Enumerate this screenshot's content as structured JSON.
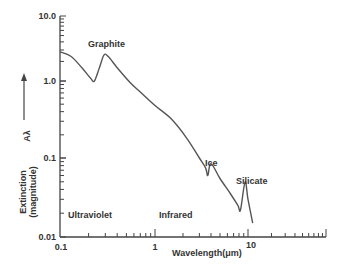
{
  "chart_data": {
    "type": "line",
    "title": "",
    "xlabel": "Wavelength(μm)",
    "ylabel": "Extinction (magnitude)",
    "ylabel_symbol": "Aλ",
    "xscale": "log",
    "yscale": "log",
    "xlim": [
      0.1,
      100
    ],
    "ylim": [
      0.01,
      10.0
    ],
    "x_tick_labels": [
      "0.1",
      "1",
      "10"
    ],
    "y_tick_labels": [
      "0.01",
      "0.1",
      "1.0",
      "10.0"
    ],
    "grid": false,
    "legend": null,
    "annotations": [
      {
        "text": "Graphite",
        "x": 0.3,
        "y": 3.0
      },
      {
        "text": "Ice",
        "x": 3.5,
        "y": 0.09
      },
      {
        "text": "Silicate",
        "x": 9.5,
        "y": 0.055
      },
      {
        "text": "Ultraviolet",
        "x": 0.15,
        "y": 0.015
      },
      {
        "text": "Infrared",
        "x": 0.7,
        "y": 0.015
      }
    ],
    "series": [
      {
        "name": "Extinction curve",
        "x": [
          0.1,
          0.13,
          0.17,
          0.21,
          0.23,
          0.26,
          0.29,
          0.32,
          0.4,
          0.55,
          0.7,
          1.0,
          1.5,
          2.2,
          3.0,
          3.5,
          3.7,
          4.0,
          5.0,
          6.5,
          7.8,
          8.3,
          9.3,
          10.0,
          11.5
        ],
        "y": [
          2.8,
          2.4,
          1.6,
          1.1,
          1.0,
          1.6,
          2.5,
          2.4,
          1.6,
          0.95,
          0.72,
          0.48,
          0.32,
          0.18,
          0.1,
          0.075,
          0.06,
          0.085,
          0.055,
          0.035,
          0.025,
          0.022,
          0.05,
          0.03,
          0.015
        ]
      }
    ]
  },
  "labels": {
    "graphite": "Graphite",
    "ice": "Ice",
    "silicate": "Silicate",
    "ultraviolet": "Ultraviolet",
    "infrared": "Infrared",
    "xlabel": "Wavelength(μm)",
    "ylabel_line1": "Extinction",
    "ylabel_line2": "(magnitude)",
    "ylabel_symbol": "Aλ",
    "x_ticks": [
      "0.1",
      "1",
      "10"
    ],
    "y_ticks": [
      "10.0",
      "1.0",
      "0.1",
      "0.01"
    ]
  }
}
